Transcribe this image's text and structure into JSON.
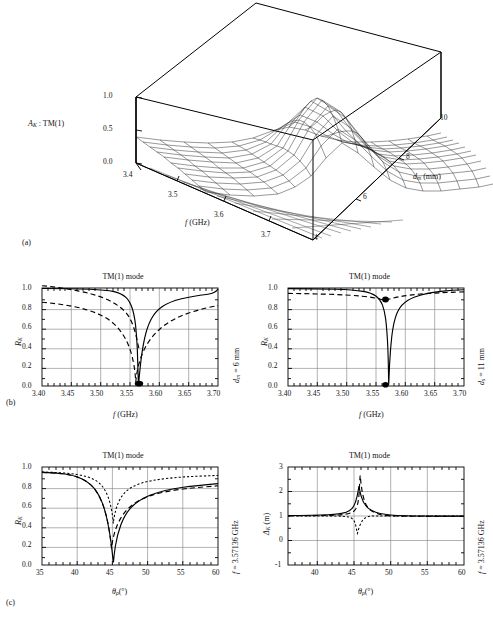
{
  "figure": {
    "panels": [
      {
        "id": "a",
        "caption": "(a)"
      },
      {
        "id": "b",
        "caption": "(b)"
      },
      {
        "id": "c",
        "caption": "(c)"
      }
    ]
  },
  "panel_a": {
    "caption": "(a)",
    "zlabel": "ᵉₖ : TM(1)",
    "zlabel_html": "A_K : TM(1)",
    "xlabel": "f (GHz)",
    "ylabel": "d_m (mm)",
    "zticks": [
      "0.0",
      "0.5",
      "1.0"
    ],
    "xticks": [
      "3.4",
      "3.5",
      "3.6",
      "3.7"
    ],
    "yticks": [
      "4",
      "6",
      "8",
      "10"
    ]
  },
  "panel_b_left": {
    "title": "TM(1) mode",
    "xlabel": "f (GHz)",
    "ylabel": "R_K",
    "right_label": "d_m = 6 mm",
    "caption": "(b)",
    "xticks": [
      "3.40",
      "3.45",
      "3.50",
      "3.55",
      "3.60",
      "3.65",
      "3.70"
    ],
    "yticks": [
      "0.0",
      "0.2",
      "0.4",
      "0.6",
      "0.8",
      "1.0"
    ]
  },
  "panel_b_right": {
    "title": "TM(1) mode",
    "xlabel": "f (GHz)",
    "ylabel": "R_K",
    "right_label": "d_s = 11 mm",
    "xticks": [
      "3.40",
      "3.45",
      "3.50",
      "3.55",
      "3.60",
      "3.65",
      "3.70"
    ],
    "yticks": [
      "0.0",
      "0.2",
      "0.4",
      "0.6",
      "0.8",
      "1.0"
    ]
  },
  "panel_c_left": {
    "title": "TM(1) mode",
    "xlabel": "θ_ρ(°)",
    "ylabel": "R_K",
    "right_label": "f = 3.57136 GHz",
    "caption": "(c)",
    "xticks": [
      "35",
      "40",
      "45",
      "50",
      "55",
      "60"
    ],
    "yticks": [
      "0.0",
      "0.2",
      "0.4",
      "0.6",
      "0.8",
      "1.0"
    ]
  },
  "panel_c_right": {
    "title": "TM(1) mode",
    "xlabel": "θ_ρ(°)",
    "ylabel": "Δ_K (m)",
    "right_label": "f = 3.57136 GHz",
    "xticks": [
      "40",
      "45",
      "50",
      "55",
      "60"
    ],
    "yticks": [
      "-1",
      "0",
      "1",
      "2",
      "3"
    ]
  },
  "chart_data": [
    {
      "id": "a",
      "type": "surface",
      "title": "",
      "zlabel": "A_K : TM(1)",
      "xlabel": "f (GHz)",
      "ylabel": "d_m (mm)",
      "xlim": [
        3.4,
        3.7
      ],
      "ylim": [
        4,
        10
      ],
      "zlim": [
        0.0,
        1.0
      ],
      "xticks": [
        3.4,
        3.5,
        3.6,
        3.7
      ],
      "yticks": [
        4,
        6,
        8,
        10
      ],
      "zticks": [
        0.0,
        0.5,
        1.0
      ],
      "grid": true,
      "legend": "none",
      "description": "Absorptance A_K of TM(1) mode as a 3-D surface over frequency f and magnetic-wall spacing d_m; a narrow resonance ridge peaking near A_K=0.9 runs diagonally, sharpening toward small d_m."
    },
    {
      "id": "b-left",
      "type": "line",
      "title": "TM(1) mode",
      "xlabel": "f (GHz)",
      "ylabel": "R_K",
      "xlim": [
        3.4,
        3.7
      ],
      "ylim": [
        0.0,
        1.0
      ],
      "xticks": [
        3.4,
        3.45,
        3.5,
        3.55,
        3.6,
        3.65,
        3.7
      ],
      "yticks": [
        0.0,
        0.2,
        0.4,
        0.6,
        0.8,
        1.0
      ],
      "grid": true,
      "legend": "none",
      "annotations": [
        "d_m = 6 mm"
      ],
      "markers": [
        {
          "x": 3.5735,
          "y": 0.02,
          "style": "filled-circle"
        }
      ],
      "series": [
        {
          "name": "solid",
          "style": "solid",
          "x": [
            3.4,
            3.44,
            3.48,
            3.51,
            3.53,
            3.54,
            3.548,
            3.554,
            3.56,
            3.565,
            3.569,
            3.5715,
            3.5735,
            3.5755,
            3.578,
            3.582,
            3.587,
            3.593,
            3.6,
            3.61,
            3.625,
            3.645,
            3.67,
            3.7
          ],
          "y": [
            0.995,
            0.995,
            0.993,
            0.99,
            0.983,
            0.972,
            0.95,
            0.905,
            0.8,
            0.62,
            0.38,
            0.2,
            0.03,
            0.14,
            0.33,
            0.56,
            0.76,
            0.88,
            0.94,
            0.972,
            0.985,
            0.992,
            0.995,
            0.997
          ]
        },
        {
          "name": "dashed",
          "style": "dashed",
          "x": [
            3.4,
            3.42,
            3.44,
            3.46,
            3.48,
            3.495,
            3.51,
            3.522,
            3.534,
            3.545,
            3.554,
            3.562,
            3.568,
            3.5735,
            3.58,
            3.588,
            3.597,
            3.607,
            3.618,
            3.63,
            3.645,
            3.66,
            3.68,
            3.7
          ],
          "y": [
            0.855,
            0.845,
            0.83,
            0.812,
            0.79,
            0.765,
            0.73,
            0.69,
            0.63,
            0.545,
            0.445,
            0.33,
            0.2,
            0.03,
            0.155,
            0.33,
            0.48,
            0.6,
            0.69,
            0.76,
            0.815,
            0.852,
            0.876,
            0.89
          ]
        }
      ]
    },
    {
      "id": "b-right",
      "type": "line",
      "title": "TM(1) mode",
      "xlabel": "f (GHz)",
      "ylabel": "R_K",
      "xlim": [
        3.4,
        3.7
      ],
      "ylim": [
        0.0,
        1.0
      ],
      "xticks": [
        3.4,
        3.45,
        3.5,
        3.55,
        3.6,
        3.65,
        3.7
      ],
      "yticks": [
        0.0,
        0.2,
        0.4,
        0.6,
        0.8,
        1.0
      ],
      "grid": true,
      "legend": "none",
      "annotations": [
        "d_s = 11 mm"
      ],
      "markers": [
        {
          "x": 3.5735,
          "y": 0.01,
          "style": "filled-circle"
        },
        {
          "x": 3.5735,
          "y": 0.885,
          "style": "filled-circle"
        }
      ],
      "series": [
        {
          "name": "solid",
          "style": "solid",
          "x": [
            3.4,
            3.45,
            3.49,
            3.515,
            3.532,
            3.543,
            3.552,
            3.56,
            3.566,
            3.57,
            3.5735,
            3.577,
            3.581,
            3.586,
            3.592,
            3.6,
            3.61,
            3.625,
            3.645,
            3.67,
            3.7
          ],
          "y": [
            0.995,
            0.993,
            0.988,
            0.98,
            0.965,
            0.945,
            0.905,
            0.82,
            0.64,
            0.37,
            0.01,
            0.33,
            0.62,
            0.8,
            0.895,
            0.945,
            0.968,
            0.982,
            0.99,
            0.993,
            0.995
          ]
        },
        {
          "name": "dashed",
          "style": "dashed",
          "x": [
            3.4,
            3.43,
            3.46,
            3.49,
            3.52,
            3.545,
            3.56,
            3.57,
            3.5735,
            3.578,
            3.59,
            3.61,
            3.635,
            3.66,
            3.7
          ],
          "y": [
            0.945,
            0.942,
            0.938,
            0.932,
            0.924,
            0.912,
            0.9,
            0.89,
            0.885,
            0.89,
            0.905,
            0.925,
            0.938,
            0.944,
            0.948
          ]
        }
      ]
    },
    {
      "id": "c-left",
      "type": "line",
      "title": "TM(1) mode",
      "xlabel": "theta_rho (deg)",
      "ylabel": "R_K",
      "xlim": [
        35,
        60
      ],
      "ylim": [
        0.0,
        1.0
      ],
      "xticks": [
        35,
        40,
        45,
        50,
        55,
        60
      ],
      "yticks": [
        0.0,
        0.2,
        0.4,
        0.6,
        0.8,
        1.0
      ],
      "grid": true,
      "legend": "none",
      "annotations": [
        "f = 3.57136 GHz"
      ],
      "series": [
        {
          "name": "solid",
          "style": "solid",
          "x": [
            35,
            37,
            39,
            40.5,
            41.5,
            42.3,
            43.0,
            43.5,
            44.0,
            44.3,
            44.6,
            44.9,
            45.2,
            45.6,
            46.2,
            47.0,
            48.0,
            49.5,
            51,
            53,
            56,
            60
          ],
          "y": [
            0.945,
            0.94,
            0.925,
            0.895,
            0.855,
            0.79,
            0.68,
            0.56,
            0.37,
            0.23,
            0.11,
            0.06,
            0.3,
            0.54,
            0.72,
            0.83,
            0.89,
            0.925,
            0.94,
            0.948,
            0.952,
            0.958
          ]
        },
        {
          "name": "dashed",
          "style": "dashed",
          "x": [
            35,
            37,
            39,
            40.5,
            41.5,
            42.3,
            43.0,
            43.6,
            44.0,
            44.4,
            44.8,
            45.1,
            45.5,
            46.0,
            46.8,
            47.8,
            49.0,
            51,
            53,
            56,
            60
          ],
          "y": [
            0.944,
            0.938,
            0.922,
            0.89,
            0.848,
            0.782,
            0.672,
            0.52,
            0.37,
            0.23,
            0.15,
            0.3,
            0.54,
            0.7,
            0.82,
            0.88,
            0.915,
            0.938,
            0.947,
            0.952,
            0.958
          ]
        },
        {
          "name": "dotted",
          "style": "dotted",
          "x": [
            35,
            37,
            39,
            40.5,
            41.8,
            42.8,
            43.6,
            44.2,
            44.6,
            44.9,
            45.2,
            45.6,
            46.1,
            46.8,
            47.8,
            49.0,
            51,
            53,
            56,
            60
          ],
          "y": [
            0.95,
            0.948,
            0.943,
            0.934,
            0.915,
            0.88,
            0.79,
            0.64,
            0.48,
            0.39,
            0.47,
            0.66,
            0.8,
            0.88,
            0.92,
            0.94,
            0.95,
            0.953,
            0.956,
            0.96
          ]
        }
      ]
    },
    {
      "id": "c-right",
      "type": "line",
      "title": "TM(1) mode",
      "xlabel": "theta_rho (deg)",
      "ylabel": "Delta_K (m)",
      "xlim": [
        36,
        60
      ],
      "ylim": [
        -1,
        3
      ],
      "xticks": [
        40,
        45,
        50,
        55,
        60
      ],
      "yticks": [
        -1,
        0,
        1,
        2,
        3
      ],
      "grid": true,
      "legend": "none",
      "annotations": [
        "f = 3.57136 GHz"
      ],
      "series": [
        {
          "name": "solid",
          "style": "solid",
          "x": [
            36,
            38,
            40,
            41.5,
            42.5,
            43.2,
            43.8,
            44.1,
            44.35,
            44.5,
            44.65,
            44.8,
            45.0,
            45.3,
            45.8,
            46.5,
            47.5,
            49,
            51,
            54,
            57,
            60
          ],
          "y": [
            0.02,
            0.03,
            0.06,
            0.11,
            0.19,
            0.3,
            0.52,
            0.78,
            1.05,
            1.22,
            1.12,
            0.9,
            0.62,
            0.4,
            0.25,
            0.15,
            0.09,
            0.05,
            0.03,
            0.02,
            0.01,
            0.01
          ]
        },
        {
          "name": "dashed",
          "style": "dashed",
          "x": [
            36,
            39,
            41.5,
            42.8,
            43.5,
            43.9,
            44.15,
            44.35,
            44.5,
            44.62,
            44.75,
            44.9,
            45.1,
            45.4,
            45.9,
            46.6,
            48,
            50,
            53,
            57,
            60
          ],
          "y": [
            0.01,
            0.02,
            0.05,
            0.12,
            0.28,
            0.6,
            1.1,
            1.75,
            2.25,
            2.45,
            2.2,
            1.55,
            0.9,
            0.48,
            0.25,
            0.14,
            0.07,
            0.04,
            0.02,
            0.01,
            0.01
          ]
        },
        {
          "name": "dotted",
          "style": "dotted",
          "x": [
            36,
            40,
            42.5,
            43.5,
            44.0,
            44.3,
            44.55,
            44.75,
            44.9,
            45.05,
            45.2,
            45.4,
            45.7,
            46.2,
            47,
            48.5,
            51,
            55,
            60
          ],
          "y": [
            0.0,
            0.0,
            -0.01,
            -0.02,
            -0.04,
            -0.08,
            -0.18,
            -0.4,
            -0.62,
            -0.68,
            -0.48,
            -0.25,
            -0.12,
            -0.06,
            -0.03,
            -0.01,
            0.0,
            0.0,
            0.0
          ]
        }
      ]
    }
  ]
}
